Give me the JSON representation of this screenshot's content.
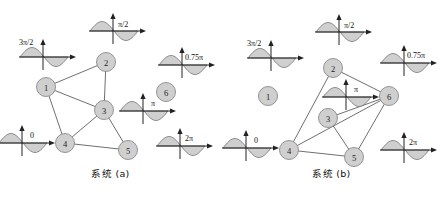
{
  "figure": {
    "title": "",
    "panels": [
      {
        "id": "system-a",
        "caption": "系统 (a)",
        "nodes": [
          {
            "id": "1",
            "label": "1",
            "cx": 46,
            "cy": 87,
            "r": 9.5
          },
          {
            "id": "2",
            "label": "2",
            "cx": 106,
            "cy": 62,
            "r": 9.5
          },
          {
            "id": "3",
            "label": "3",
            "cx": 104,
            "cy": 110,
            "r": 9.5
          },
          {
            "id": "4",
            "label": "4",
            "cx": 65,
            "cy": 143,
            "r": 9.5
          },
          {
            "id": "5",
            "label": "5",
            "cx": 128,
            "cy": 150,
            "r": 9.5
          },
          {
            "id": "6",
            "label": "6",
            "cx": 166,
            "cy": 92,
            "r": 9.5
          }
        ],
        "edges": [
          {
            "from": "1",
            "to": "2"
          },
          {
            "from": "1",
            "to": "3"
          },
          {
            "from": "1",
            "to": "4"
          },
          {
            "from": "2",
            "to": "3"
          },
          {
            "from": "3",
            "to": "4"
          },
          {
            "from": "3",
            "to": "5"
          },
          {
            "from": "4",
            "to": "5"
          }
        ],
        "waves": [
          {
            "id": "wave-a-1",
            "label": "3π/2",
            "cx": 43,
            "cy": 57,
            "label_dx": -24,
            "label_dy": -12,
            "arrow_to": null
          },
          {
            "id": "wave-a-2",
            "label": "π/2",
            "cx": 113,
            "cy": 31,
            "label_dx": 5,
            "label_dy": -4,
            "arrow_to": null
          },
          {
            "id": "wave-a-6",
            "label": "0.75π",
            "cx": 182,
            "cy": 65,
            "label_dx": 3,
            "label_dy": -5,
            "arrow_to": null
          },
          {
            "id": "wave-a-3",
            "label": "π",
            "cx": 143,
            "cy": 111,
            "label_dx": 8,
            "label_dy": -5,
            "arrow_to": null
          },
          {
            "id": "wave-a-4",
            "label": "0",
            "cx": 22,
            "cy": 143,
            "label_dx": 8,
            "label_dy": -5,
            "arrow_to": null
          },
          {
            "id": "wave-a-5",
            "label": "2π",
            "cx": 180,
            "cy": 146,
            "label_dx": 5,
            "label_dy": -5,
            "arrow_to": null
          }
        ]
      },
      {
        "id": "system-b",
        "caption": "系统 (b)",
        "nodes": [
          {
            "id": "1",
            "label": "1",
            "cx": 47,
            "cy": 96,
            "r": 9.5
          },
          {
            "id": "2",
            "label": "2",
            "cx": 112,
            "cy": 68,
            "r": 9.5
          },
          {
            "id": "3",
            "label": "3",
            "cx": 107,
            "cy": 118,
            "r": 9.5
          },
          {
            "id": "4",
            "label": "4",
            "cx": 68,
            "cy": 150,
            "r": 9.5
          },
          {
            "id": "5",
            "label": "5",
            "cx": 133,
            "cy": 157,
            "r": 9.5
          },
          {
            "id": "6",
            "label": "6",
            "cx": 168,
            "cy": 96,
            "r": 9.5
          }
        ],
        "edges": [
          {
            "from": "2",
            "to": "4"
          },
          {
            "from": "2",
            "to": "6"
          },
          {
            "from": "3",
            "to": "6"
          },
          {
            "from": "4",
            "to": "5"
          },
          {
            "from": "4",
            "to": "6"
          },
          {
            "from": "5",
            "to": "6"
          },
          {
            "from": "3",
            "to": "5"
          }
        ],
        "waves": [
          {
            "id": "wave-b-1",
            "label": "3π/2",
            "cx": 50,
            "cy": 58,
            "label_dx": -24,
            "label_dy": -12
          },
          {
            "id": "wave-b-2",
            "label": "π/2",
            "cx": 118,
            "cy": 32,
            "label_dx": 5,
            "label_dy": -4
          },
          {
            "id": "wave-b-6",
            "label": "0.75π",
            "cx": 183,
            "cy": 63,
            "label_dx": 3,
            "label_dy": -5
          },
          {
            "id": "wave-b-3",
            "label": "π",
            "cx": 125,
            "cy": 97,
            "label_dx": 8,
            "label_dy": -5
          },
          {
            "id": "wave-b-4",
            "label": "0",
            "cx": 25,
            "cy": 148,
            "label_dx": 8,
            "label_dy": -5
          },
          {
            "id": "wave-b-5",
            "label": "2π",
            "cx": 183,
            "cy": 150,
            "label_dx": 5,
            "label_dy": -5
          }
        ]
      }
    ],
    "style": {
      "node_fill": "#cfcfcf",
      "node_stroke": "#8a8a8a",
      "edge_stroke": "#555555",
      "wave_fill": "#cfcfcf",
      "wave_stroke": "#6d6d6d",
      "axis_stroke": "#222222",
      "background": "#ffffff"
    }
  }
}
